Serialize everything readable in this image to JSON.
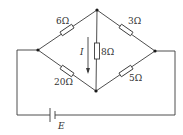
{
  "diagram": {
    "type": "circuit",
    "colors": {
      "line": "#3a3a3a",
      "node": "#1a1a1a",
      "text": "#333333",
      "background": "#ffffff"
    },
    "nodes": [
      {
        "id": "left",
        "x": 38,
        "y": 50
      },
      {
        "id": "top",
        "x": 97,
        "y": 10
      },
      {
        "id": "right",
        "x": 155,
        "y": 51
      },
      {
        "id": "bottom",
        "x": 96,
        "y": 91
      }
    ],
    "resistors": [
      {
        "id": "r1",
        "label": "6Ω",
        "between": [
          "left",
          "top"
        ]
      },
      {
        "id": "r2",
        "label": "3Ω",
        "between": [
          "top",
          "right"
        ]
      },
      {
        "id": "r3",
        "label": "8Ω",
        "between": [
          "top",
          "bottom"
        ]
      },
      {
        "id": "r4",
        "label": "20Ω",
        "between": [
          "left",
          "bottom"
        ]
      },
      {
        "id": "r5",
        "label": "5Ω",
        "between": [
          "bottom",
          "right"
        ]
      }
    ],
    "current": {
      "label": "I",
      "direction": "down"
    },
    "battery": {
      "label": "E"
    }
  }
}
